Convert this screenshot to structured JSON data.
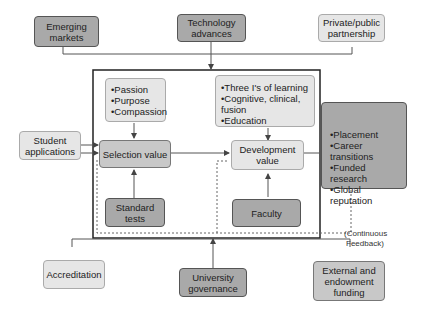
{
  "top_inputs": [
    {
      "label_lines": [
        "Emerging",
        "markets"
      ],
      "shade": "dark"
    },
    {
      "label_lines": [
        "Technology",
        "advances"
      ],
      "shade": "dark"
    },
    {
      "label_lines": [
        "Private/public",
        "partnership"
      ],
      "shade": "light"
    }
  ],
  "left_input": {
    "label_lines": [
      "Student",
      "applications"
    ]
  },
  "selection_attributes": [
    "Passion",
    "Purpose",
    "Compassion"
  ],
  "development_attributes": [
    "Three I's of learning",
    "Cognitive, clinical, fusion",
    "Education"
  ],
  "selection_value": {
    "label": "Selection value"
  },
  "development_value": {
    "label_lines": [
      "Development",
      "value"
    ]
  },
  "standard_tests": {
    "label_lines": [
      "Standard",
      "tests"
    ]
  },
  "faculty": {
    "label": "Faculty"
  },
  "outcomes": [
    "Placement",
    "Career transitions",
    "Funded research",
    "Global reputation"
  ],
  "feedback_note": {
    "label_lines": [
      "(Continuous",
      "Feedback)"
    ]
  },
  "bottom_inputs": [
    {
      "label_lines": [
        "Accreditation"
      ],
      "shade": "light"
    },
    {
      "label_lines": [
        "University",
        "governance"
      ],
      "shade": "dark"
    },
    {
      "label_lines": [
        "External and",
        "endowment",
        "funding"
      ],
      "shade": "mid"
    }
  ]
}
